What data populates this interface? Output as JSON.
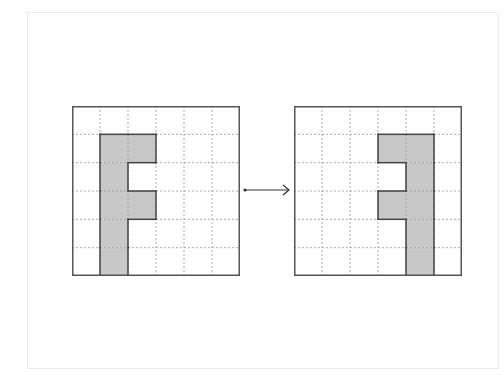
{
  "diagram": {
    "grid_size": {
      "rows": 6,
      "cols": 6
    },
    "colors": {
      "shape_fill": "#c8c8c8",
      "shape_stroke": "#444444",
      "grid_line": "#9a9a9a",
      "border": "#555555",
      "arrow": "#333333"
    },
    "left_grid": {
      "label": "original",
      "shaded_cells": [
        [
          1,
          1
        ],
        [
          1,
          2
        ],
        [
          2,
          1
        ],
        [
          3,
          1
        ],
        [
          3,
          2
        ],
        [
          4,
          1
        ],
        [
          5,
          1
        ]
      ]
    },
    "right_grid": {
      "label": "reflected",
      "shaded_cells": [
        [
          1,
          3
        ],
        [
          1,
          4
        ],
        [
          2,
          4
        ],
        [
          3,
          3
        ],
        [
          3,
          4
        ],
        [
          4,
          4
        ],
        [
          5,
          4
        ]
      ]
    },
    "arrow": {
      "direction": "right"
    }
  }
}
